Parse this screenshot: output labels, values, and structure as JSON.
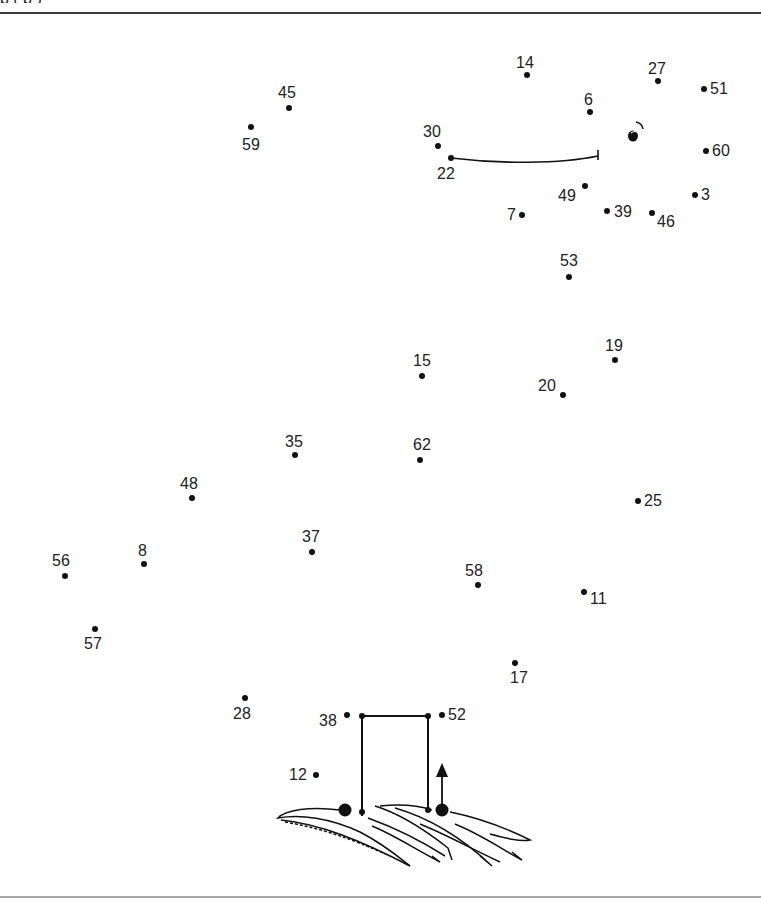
{
  "header": {
    "clipped_text": "p          (                    p                    )"
  },
  "puzzle": {
    "type": "connect-the-dots",
    "dots": [
      {
        "n": "14",
        "x": 527,
        "y": 75,
        "lx": 516,
        "ly": 55
      },
      {
        "n": "27",
        "x": 658,
        "y": 81,
        "lx": 648,
        "ly": 61
      },
      {
        "n": "51",
        "x": 704,
        "y": 89,
        "lx": 710,
        "ly": 81
      },
      {
        "n": "45",
        "x": 289,
        "y": 108,
        "lx": 278,
        "ly": 85
      },
      {
        "n": "6",
        "x": 590,
        "y": 112,
        "lx": 584,
        "ly": 92
      },
      {
        "n": "59",
        "x": 251,
        "y": 127,
        "lx": 242,
        "ly": 137
      },
      {
        "n": "30",
        "x": 438,
        "y": 146,
        "lx": 423,
        "ly": 124
      },
      {
        "n": "60",
        "x": 706,
        "y": 151,
        "lx": 712,
        "ly": 143
      },
      {
        "n": "22",
        "x": 451,
        "y": 158,
        "lx": 437,
        "ly": 166
      },
      {
        "n": "49",
        "x": 585,
        "y": 186,
        "lx": 558,
        "ly": 188
      },
      {
        "n": "3",
        "x": 695,
        "y": 195,
        "lx": 701,
        "ly": 187
      },
      {
        "n": "39",
        "x": 607,
        "y": 211,
        "lx": 614,
        "ly": 204
      },
      {
        "n": "46",
        "x": 652,
        "y": 213,
        "lx": 657,
        "ly": 214
      },
      {
        "n": "7",
        "x": 522,
        "y": 215,
        "lx": 507,
        "ly": 207
      },
      {
        "n": "53",
        "x": 569,
        "y": 277,
        "lx": 560,
        "ly": 253
      },
      {
        "n": "19",
        "x": 615,
        "y": 360,
        "lx": 605,
        "ly": 338
      },
      {
        "n": "15",
        "x": 422,
        "y": 376,
        "lx": 413,
        "ly": 353
      },
      {
        "n": "20",
        "x": 563,
        "y": 395,
        "lx": 538,
        "ly": 378
      },
      {
        "n": "35",
        "x": 295,
        "y": 455,
        "lx": 285,
        "ly": 434
      },
      {
        "n": "62",
        "x": 420,
        "y": 460,
        "lx": 413,
        "ly": 437
      },
      {
        "n": "48",
        "x": 192,
        "y": 498,
        "lx": 180,
        "ly": 476
      },
      {
        "n": "25",
        "x": 638,
        "y": 501,
        "lx": 644,
        "ly": 493
      },
      {
        "n": "37",
        "x": 312,
        "y": 552,
        "lx": 302,
        "ly": 529
      },
      {
        "n": "8",
        "x": 144,
        "y": 564,
        "lx": 138,
        "ly": 543
      },
      {
        "n": "56",
        "x": 65,
        "y": 576,
        "lx": 52,
        "ly": 553
      },
      {
        "n": "58",
        "x": 478,
        "y": 585,
        "lx": 465,
        "ly": 563
      },
      {
        "n": "11",
        "x": 584,
        "y": 592,
        "lx": 590,
        "ly": 591
      },
      {
        "n": "57",
        "x": 95,
        "y": 629,
        "lx": 84,
        "ly": 636
      },
      {
        "n": "17",
        "x": 515,
        "y": 663,
        "lx": 510,
        "ly": 670
      },
      {
        "n": "28",
        "x": 245,
        "y": 698,
        "lx": 233,
        "ly": 706
      },
      {
        "n": "38",
        "x": 347,
        "y": 715,
        "lx": 319,
        "ly": 713
      },
      {
        "n": "52",
        "x": 442,
        "y": 715,
        "lx": 448,
        "ly": 707
      },
      {
        "n": "12",
        "x": 316,
        "y": 775,
        "lx": 289,
        "ly": 767
      }
    ],
    "start_marker": "arrow-up",
    "colors": {
      "ink": "#111111",
      "rule_top": "#3a3a3a",
      "rule_bottom": "#a9a9a9",
      "background": "#ffffff"
    }
  }
}
